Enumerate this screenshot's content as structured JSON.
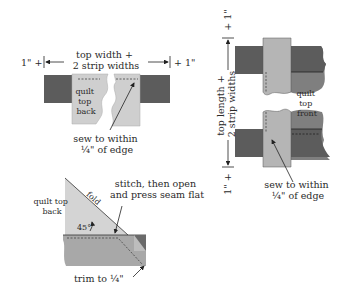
{
  "colors": {
    "dark_strip": "#5c5c5c",
    "mid_strip": "#8a8a8a",
    "light_fabric": "#cfcfcf",
    "light_strip": "#b5b5b5",
    "line": "#333333",
    "background": "#ffffff"
  },
  "top_left": {
    "dim_left": "1\" +",
    "dim_right": "+ 1\"",
    "dim_line1": "top width +",
    "dim_line2": "2 strip widths",
    "fabric_label_1": "quilt",
    "fabric_label_2": "top",
    "fabric_label_3": "back",
    "callout_line1": "sew to within",
    "callout_line2": "¼\" of edge"
  },
  "right": {
    "dim_top": "+ 1\"",
    "dim_bottom": "1\" +",
    "dim_line1": "top length +",
    "dim_line2": "2 strip widths",
    "fabric_label_1": "quilt",
    "fabric_label_2": "top",
    "fabric_label_3": "front",
    "callout_line1": "sew to within",
    "callout_line2": "¼\" of edge"
  },
  "bottom_left": {
    "fabric_label_1": "quilt top",
    "fabric_label_2": "back",
    "fold_label": "fold",
    "angle_label": "45°",
    "callout_line1": "stitch, then open",
    "callout_line2": "and press seam flat",
    "trim_label": "trim to ¼\""
  }
}
